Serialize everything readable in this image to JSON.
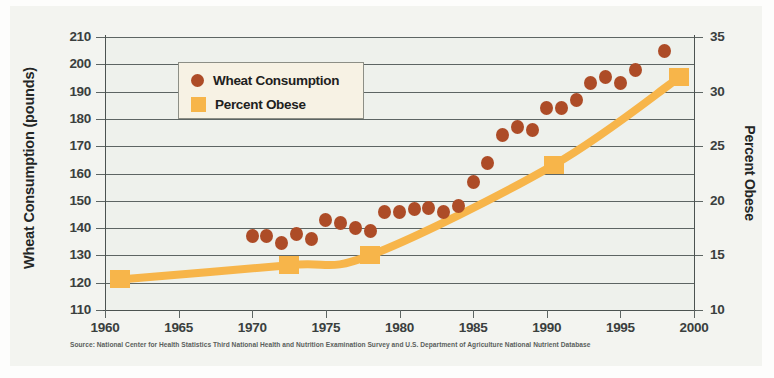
{
  "figure": {
    "source_note": "Source: National Center for Health Statistics Third National Health and Nutrition Examination Survey and U.S. Department of Agriculture National Nutrient Database",
    "background_color": "#f3f4f0",
    "plot_background_color": "#eef1ec"
  },
  "legend": {
    "position": "upper-left-inside",
    "items": [
      {
        "label": "Wheat Consumption",
        "marker": "circle",
        "color": "#ad4c27",
        "icon": "legend-circle-icon"
      },
      {
        "label": "Percent Obese",
        "marker": "square",
        "color": "#f7b54a",
        "icon": "legend-square-icon"
      }
    ]
  },
  "axes": {
    "left": {
      "title": "Wheat Consumption (pounds)",
      "ticks": [
        110,
        120,
        130,
        140,
        150,
        160,
        170,
        180,
        190,
        200,
        210
      ],
      "min": 110,
      "max": 210
    },
    "right": {
      "title": "Percent Obese",
      "ticks": [
        10,
        15,
        20,
        25,
        30,
        35
      ],
      "min": 10,
      "max": 35
    },
    "bottom": {
      "title": "",
      "ticks": [
        1960,
        1965,
        1970,
        1975,
        1980,
        1985,
        1990,
        1995,
        2000
      ],
      "min": 1960,
      "max": 2000
    }
  },
  "chart_data": {
    "type": "scatter",
    "title": "",
    "subtitle": "",
    "xlabel": "",
    "ylabel": "Wheat Consumption (pounds)",
    "y2label": "Percent Obese",
    "xlim": [
      1960,
      2000
    ],
    "ylim": [
      110,
      210
    ],
    "y2lim": [
      10,
      35
    ],
    "grid": true,
    "grid_axis": "y",
    "legend_position": "upper left",
    "annotations": [
      "Source: National Center for Health Statistics Third National Health and Nutrition Examination Survey and U.S. Department of Agriculture National Nutrient Database"
    ],
    "series": [
      {
        "name": "Wheat Consumption",
        "type": "scatter",
        "axis": "left",
        "units": "pounds",
        "color": "#ad4c27",
        "marker": "circle",
        "x": [
          1970,
          1971,
          1972,
          1973,
          1974,
          1975,
          1976,
          1977,
          1978,
          1979,
          1980,
          1981,
          1982,
          1983,
          1984,
          1985,
          1986,
          1987,
          1988,
          1989,
          1990,
          1991,
          1992,
          1993,
          1994,
          1995,
          1996,
          1998
        ],
        "values": [
          137,
          137,
          134.5,
          138,
          136,
          143,
          142,
          140,
          139,
          146,
          146,
          147,
          147.5,
          146,
          148,
          157,
          164,
          174,
          177,
          176,
          184,
          184,
          187,
          193,
          195.5,
          193,
          198,
          205
        ]
      },
      {
        "name": "Percent Obese",
        "type": "line",
        "axis": "right",
        "units": "percent",
        "color": "#f7b54a",
        "marker": "square",
        "x": [
          1961,
          1972.5,
          1978,
          1990.5,
          1999
        ],
        "values": [
          12.8,
          14.1,
          15.0,
          23.3,
          31.3
        ]
      }
    ]
  }
}
